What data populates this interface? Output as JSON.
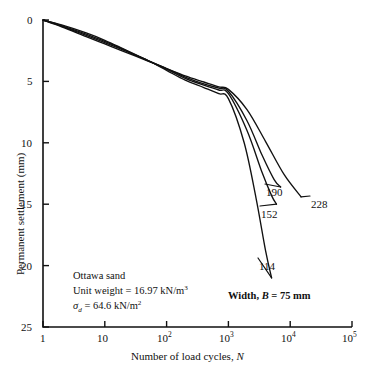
{
  "figure": {
    "background_color": "#ffffff",
    "ink_color": "#111111"
  },
  "chart_data": {
    "type": "line",
    "title": "",
    "xlabel_plain": "Number of load cycles, N",
    "xlabel_text": "Number of load cycles,",
    "xlabel_symbol": "N",
    "ylabel": "Permanent settlement (mm)",
    "x_scale": "log10",
    "xlim": [
      1,
      100000
    ],
    "ylim": [
      0,
      25
    ],
    "y_inverted": true,
    "grid": false,
    "legend": "inline curve end labels",
    "x_tick_labels": [
      "1",
      "10",
      "10²",
      "10³",
      "10⁴",
      "10⁵"
    ],
    "x_tick_bases": [
      "1",
      "10",
      "10",
      "10",
      "10",
      "10"
    ],
    "x_tick_exponents": [
      "",
      "",
      "2",
      "3",
      "4",
      "5"
    ],
    "x_tick_values": [
      1,
      10,
      100,
      1000,
      10000,
      100000
    ],
    "y_tick_labels": [
      "0",
      "5",
      "10",
      "15",
      "20",
      "25"
    ],
    "y_tick_values": [
      0,
      5,
      10,
      15,
      20,
      25
    ],
    "series": [
      {
        "name": "228",
        "label": "228",
        "points": [
          [
            1,
            0.0
          ],
          [
            2,
            0.55
          ],
          [
            5,
            1.35
          ],
          [
            10,
            1.95
          ],
          [
            20,
            2.55
          ],
          [
            50,
            3.35
          ],
          [
            100,
            3.95
          ],
          [
            200,
            4.55
          ],
          [
            400,
            5.05
          ],
          [
            700,
            5.45
          ],
          [
            1000,
            5.65
          ],
          [
            2000,
            7.3
          ],
          [
            4000,
            9.9
          ],
          [
            8000,
            12.6
          ],
          [
            15000,
            14.4
          ]
        ]
      },
      {
        "name": "190",
        "label": "190",
        "points": [
          [
            1,
            0.0
          ],
          [
            2,
            0.5
          ],
          [
            5,
            1.25
          ],
          [
            10,
            1.85
          ],
          [
            20,
            2.45
          ],
          [
            50,
            3.3
          ],
          [
            100,
            3.95
          ],
          [
            200,
            4.65
          ],
          [
            400,
            5.2
          ],
          [
            700,
            5.55
          ],
          [
            1000,
            5.8
          ],
          [
            2000,
            8.2
          ],
          [
            3500,
            11.0
          ],
          [
            5500,
            13.0
          ],
          [
            7000,
            13.6
          ]
        ]
      },
      {
        "name": "152",
        "label": "152",
        "points": [
          [
            1,
            0.0
          ],
          [
            2,
            0.45
          ],
          [
            5,
            1.15
          ],
          [
            10,
            1.75
          ],
          [
            20,
            2.4
          ],
          [
            50,
            3.3
          ],
          [
            100,
            4.0
          ],
          [
            200,
            4.75
          ],
          [
            400,
            5.3
          ],
          [
            700,
            5.7
          ],
          [
            1000,
            6.0
          ],
          [
            2000,
            9.0
          ],
          [
            3500,
            12.4
          ],
          [
            5000,
            14.3
          ],
          [
            6000,
            15.0
          ]
        ]
      },
      {
        "name": "114",
        "label": "114",
        "points": [
          [
            1,
            0.0
          ],
          [
            2,
            0.4
          ],
          [
            5,
            1.05
          ],
          [
            10,
            1.65
          ],
          [
            20,
            2.35
          ],
          [
            50,
            3.3
          ],
          [
            100,
            4.1
          ],
          [
            200,
            4.9
          ],
          [
            400,
            5.5
          ],
          [
            700,
            6.0
          ],
          [
            1000,
            6.4
          ],
          [
            1800,
            10.0
          ],
          [
            2800,
            14.5
          ],
          [
            4000,
            18.8
          ],
          [
            5000,
            21.0
          ]
        ]
      }
    ],
    "annotations": {
      "material": "Ottawa sand",
      "unit_weight_label": "Unit weight =",
      "unit_weight_value": "16.97 kN/m",
      "unit_weight_exponent": "3",
      "stress_symbol": "σ",
      "stress_subscript": "d",
      "stress_equals": "= 64.6 kN/m",
      "stress_exponent": "2",
      "width_prefix": "Width,",
      "width_symbol": "B",
      "width_value": "= 75 mm"
    }
  }
}
